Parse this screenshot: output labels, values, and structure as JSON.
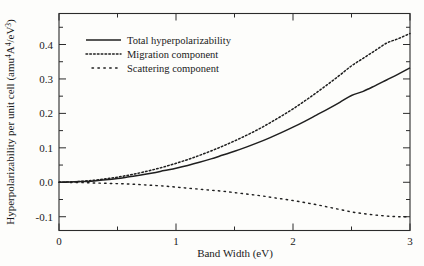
{
  "chart_data": {
    "type": "line",
    "title": "",
    "xlabel": "Band Width (eV)",
    "ylabel": "Hyperpolarizability per unit cell (amu",
    "ylabel_parts": {
      "main": "Hyperpolarizability per unit cell (amu",
      "sup1": "4",
      "mid": "A",
      "sup2": "4",
      "div": "/eV",
      "sup3": "3",
      "close": ")"
    },
    "xlim": [
      0,
      3
    ],
    "ylim": [
      -0.14,
      0.49
    ],
    "grid": false,
    "legend_position": "upper-left-inside",
    "xticks": [
      0,
      1,
      2,
      3
    ],
    "xtick_labels": [
      "0",
      "1",
      "2",
      "3"
    ],
    "xminor_ticks": [
      0.5,
      1.5,
      2.5
    ],
    "yticks": [
      -0.1,
      0.0,
      0.1,
      0.2,
      0.3,
      0.4
    ],
    "ytick_labels": [
      "-0.1",
      "0.0",
      "0.1",
      "0.2",
      "0.3",
      "0.4"
    ],
    "yminor_ticks": [
      -0.05,
      0.05,
      0.15,
      0.25,
      0.35,
      0.45
    ],
    "x": [
      0.0,
      0.1,
      0.2,
      0.3,
      0.4,
      0.5,
      0.6,
      0.7,
      0.8,
      0.9,
      1.0,
      1.1,
      1.2,
      1.3,
      1.4,
      1.5,
      1.6,
      1.7,
      1.8,
      1.9,
      2.0,
      2.1,
      2.2,
      2.3,
      2.4,
      2.5,
      2.6,
      2.7,
      2.8,
      2.9,
      3.0
    ],
    "series": [
      {
        "name": "Total hyperpolarizability",
        "style": "solid",
        "values": [
          0.0,
          0.001,
          0.002,
          0.004,
          0.007,
          0.011,
          0.016,
          0.021,
          0.027,
          0.034,
          0.041,
          0.049,
          0.058,
          0.068,
          0.079,
          0.09,
          0.102,
          0.115,
          0.129,
          0.144,
          0.16,
          0.177,
          0.195,
          0.213,
          0.232,
          0.252,
          0.264,
          0.28,
          0.297,
          0.314,
          0.332
        ]
      },
      {
        "name": "Migration component",
        "style": "dotted-fine",
        "values": [
          0.0,
          0.001,
          0.003,
          0.006,
          0.01,
          0.015,
          0.021,
          0.028,
          0.036,
          0.045,
          0.055,
          0.066,
          0.078,
          0.091,
          0.105,
          0.12,
          0.136,
          0.153,
          0.172,
          0.192,
          0.213,
          0.236,
          0.26,
          0.285,
          0.311,
          0.338,
          0.36,
          0.382,
          0.404,
          0.417,
          0.432
        ]
      },
      {
        "name": "Scattering component",
        "style": "dashed-sparse",
        "values": [
          0.0,
          -0.0005,
          -0.001,
          -0.002,
          -0.003,
          -0.004,
          -0.005,
          -0.007,
          -0.009,
          -0.011,
          -0.014,
          -0.017,
          -0.02,
          -0.023,
          -0.026,
          -0.03,
          -0.034,
          -0.038,
          -0.043,
          -0.048,
          -0.053,
          -0.059,
          -0.065,
          -0.072,
          -0.079,
          -0.086,
          -0.091,
          -0.095,
          -0.098,
          -0.1,
          -0.1
        ]
      }
    ],
    "legend": [
      "Total hyperpolarizability",
      "Migration component",
      "Scattering component"
    ],
    "colors": {
      "line": "#1f1f1f",
      "axis": "#2b2b2b",
      "background": "#fdfdfb"
    }
  }
}
